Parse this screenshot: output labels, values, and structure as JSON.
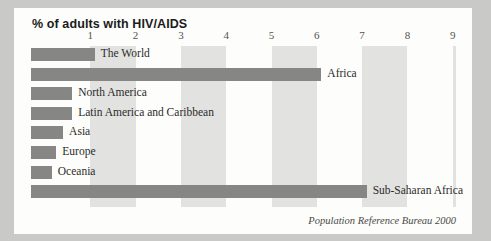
{
  "figure": {
    "title": "% of adults with HIV/AIDS",
    "source_note": "Population Reference Bureau 2000"
  },
  "colors": {
    "bar": "#868684",
    "band": "#e2e2e0",
    "card": "#fdfdfb",
    "page": "#c9c9c7",
    "text": "#2b2b29",
    "tick_text": "#54534f"
  },
  "chart_data": {
    "type": "bar",
    "orientation": "horizontal",
    "title": "% of adults with HIV/AIDS",
    "xlabel": "",
    "ylabel": "",
    "xlim": [
      0,
      9.4
    ],
    "grid": "alternating vertical bands every 1 unit",
    "legend": "none",
    "tick_labels": [
      "1",
      "2",
      "3",
      "4",
      "5",
      "6",
      "7",
      "8",
      "9"
    ],
    "tick_values": [
      1,
      2,
      3,
      4,
      5,
      6,
      7,
      8,
      9
    ],
    "annotation": "Population Reference Bureau 2000",
    "categories": [
      "The World",
      "Africa",
      "North America",
      "Latin America and Caribbean",
      "Asia",
      "Europe",
      "Oceania",
      "Sub-Saharan Africa"
    ],
    "values": [
      1.1,
      6.1,
      0.6,
      0.6,
      0.4,
      0.25,
      0.15,
      7.1
    ],
    "points": [
      {
        "label": "The World",
        "value": 1.1
      },
      {
        "label": "Africa",
        "value": 6.1
      },
      {
        "label": "North America",
        "value": 0.6
      },
      {
        "label": "Latin America and Caribbean",
        "value": 0.6
      },
      {
        "label": "Asia",
        "value": 0.4
      },
      {
        "label": "Europe",
        "value": 0.25
      },
      {
        "label": "Oceania",
        "value": 0.15
      },
      {
        "label": "Sub-Saharan Africa",
        "value": 7.1
      }
    ]
  }
}
